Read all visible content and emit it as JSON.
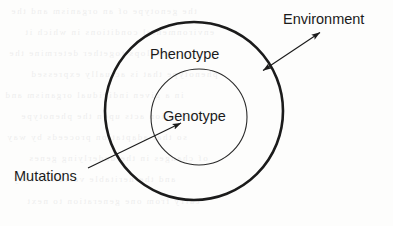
{
  "diagram": {
    "type": "concentric-venn",
    "background_color": "#fdfdfc",
    "stroke_color": "#1b1b1b",
    "labels": {
      "phenotype": "Phenotype",
      "genotype": "Genotype",
      "environment": "Environment",
      "mutations": "Mutations"
    },
    "shapes": [
      {
        "name": "outer-circle",
        "label": "Phenotype",
        "cx": 194,
        "cy": 111,
        "r": 89,
        "stroke_width": 2.6,
        "fill": "none"
      },
      {
        "name": "inner-circle",
        "label": "Genotype",
        "cx": 199,
        "cy": 117,
        "r": 48,
        "stroke_width": 1.1,
        "fill": "none"
      }
    ],
    "arrows": [
      {
        "name": "environment-arrow",
        "label": "Environment",
        "heads": "double",
        "x1": 261,
        "y1": 72,
        "x2": 322,
        "y2": 31,
        "stroke_width": 1.1
      },
      {
        "name": "mutations-arrow",
        "label": "Mutations",
        "heads": "single",
        "x1": 88,
        "y1": 168,
        "x2": 183,
        "y2": 122,
        "stroke_width": 1.1
      }
    ]
  },
  "scan_artifacts": {
    "note": "faint mirrored show-through text from reverse side of scanned page",
    "lines": [
      "the genotype of an organism and the",
      "environmental conditions in which it",
      "develops together determine the",
      "phenotype that is actually expressed",
      "in a given individual organism and",
      "selection acts upon the phenotype",
      "so that adaptation proceeds by way",
      "of changes in the underlying genes",
      "and the heritable variation they",
      "carry from one generation to next"
    ]
  }
}
